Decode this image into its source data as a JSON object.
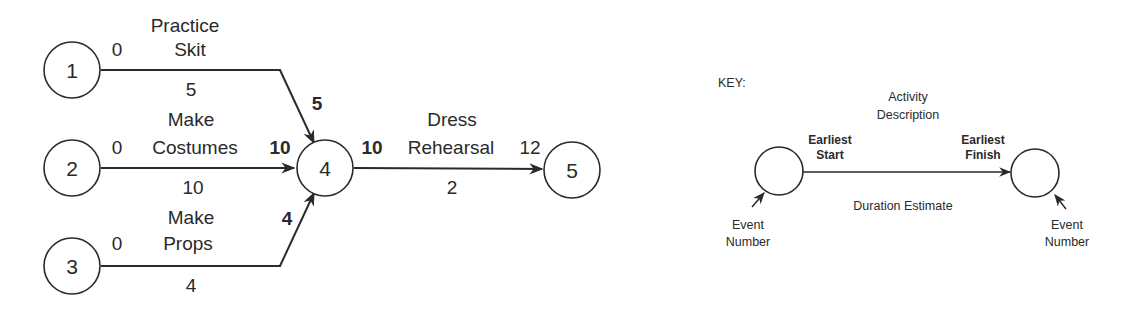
{
  "network": {
    "nodes": [
      {
        "id": "1",
        "label": "1"
      },
      {
        "id": "2",
        "label": "2"
      },
      {
        "id": "3",
        "label": "3"
      },
      {
        "id": "4",
        "label": "4"
      },
      {
        "id": "5",
        "label": "5"
      }
    ],
    "activities": [
      {
        "from": "1",
        "to": "4",
        "desc_line1": "Practice",
        "desc_line2": "Skit",
        "earliest_start": "0",
        "duration": "5",
        "earliest_finish": "5"
      },
      {
        "from": "2",
        "to": "4",
        "desc_line1": "Make",
        "desc_line2": "Costumes",
        "earliest_start": "0",
        "duration": "10",
        "earliest_finish": "10"
      },
      {
        "from": "3",
        "to": "4",
        "desc_line1": "Make",
        "desc_line2": "Props",
        "earliest_start": "0",
        "duration": "4",
        "earliest_finish": "4"
      },
      {
        "from": "4",
        "to": "5",
        "desc_line1": "Dress",
        "desc_line2": "Rehearsal",
        "earliest_start": "10",
        "duration": "2",
        "earliest_finish": "12"
      }
    ]
  },
  "key": {
    "title": "KEY:",
    "activity_line1": "Activity",
    "activity_line2": "Description",
    "es_line1": "Earliest",
    "es_line2": "Start",
    "ef_line1": "Earliest",
    "ef_line2": "Finish",
    "duration": "Duration Estimate",
    "event_left_line1": "Event",
    "event_left_line2": "Number",
    "event_right_line1": "Event",
    "event_right_line2": "Number"
  }
}
